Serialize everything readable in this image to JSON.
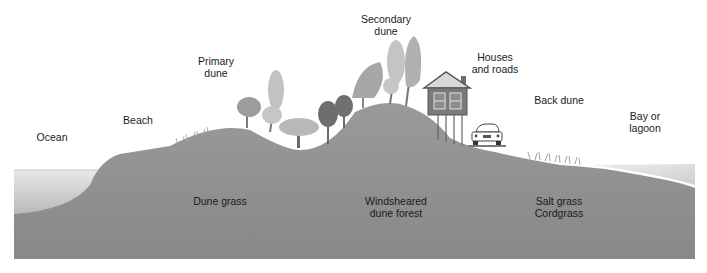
{
  "diagram": {
    "type": "coastal dune cross-section",
    "top_labels": {
      "ocean": "Ocean",
      "beach": "Beach",
      "primary_dune": [
        "Primary",
        "dune"
      ],
      "secondary_dune": [
        "Secondary",
        "dune"
      ],
      "houses_roads": [
        "Houses",
        "and roads"
      ],
      "back_dune": "Back dune",
      "bay_lagoon": [
        "Bay or",
        "lagoon"
      ]
    },
    "vegetation_labels": {
      "dune_grass": "Dune grass",
      "windsheared": [
        "Windsheared",
        "dune forest"
      ],
      "salt_grass": [
        "Salt grass",
        "Cordgrass"
      ]
    },
    "colors": {
      "ground": "#8f8f8f",
      "water_top": "#e6e6e6",
      "water_bottom": "#bdbdbd",
      "tree_light": "#bcbcbc",
      "tree_mid": "#9a9a9a",
      "tree_dark": "#6a6a6a",
      "house": "#7a7a7a"
    }
  }
}
